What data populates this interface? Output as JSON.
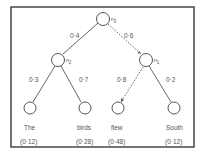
{
  "diagram": {
    "type": "probability-tree",
    "nodes": {
      "root": {
        "label": "n",
        "subscript": "3"
      },
      "left": {
        "label": "n",
        "subscript": "2"
      },
      "right": {
        "label": "n",
        "subscript": "1"
      }
    },
    "edges": {
      "root_left": {
        "weight": "0·4",
        "style": "solid"
      },
      "root_right": {
        "weight": "0·6",
        "style": "dotted"
      },
      "left_the": {
        "weight": "0·3",
        "style": "solid"
      },
      "left_birds": {
        "weight": "0·7",
        "style": "solid"
      },
      "right_flew": {
        "weight": "0·8",
        "style": "dotted"
      },
      "right_south": {
        "weight": "0·2",
        "style": "solid"
      }
    },
    "leaves": [
      {
        "word": "The",
        "prob": "(0·12)"
      },
      {
        "word": "birds",
        "prob": "(0·28)"
      },
      {
        "word": "flew",
        "prob": "(0·48)"
      },
      {
        "word": "South",
        "prob": "(0·12)"
      }
    ]
  }
}
